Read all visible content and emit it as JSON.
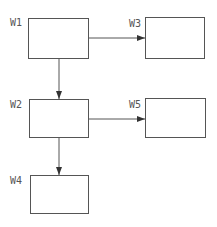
{
  "diagram": {
    "type": "flow",
    "nodes": [
      {
        "id": "W1",
        "label": "W1",
        "x": 28,
        "y": 18,
        "w": 61,
        "h": 41,
        "label_x": 10,
        "label_y": 18
      },
      {
        "id": "W2",
        "label": "W2",
        "x": 29,
        "y": 99,
        "w": 60,
        "h": 39,
        "label_x": 10,
        "label_y": 100
      },
      {
        "id": "W3",
        "label": "W3",
        "x": 145,
        "y": 17,
        "w": 60,
        "h": 42,
        "label_x": 129,
        "label_y": 19
      },
      {
        "id": "W4",
        "label": "W4",
        "x": 30,
        "y": 175,
        "w": 59,
        "h": 39,
        "label_x": 10,
        "label_y": 176
      },
      {
        "id": "W5",
        "label": "W5",
        "x": 145,
        "y": 98,
        "w": 61,
        "h": 40,
        "label_x": 129,
        "label_y": 100
      }
    ],
    "edges": [
      {
        "from": "W1",
        "to": "W3",
        "x1": 89,
        "y1": 38,
        "x2": 145,
        "y2": 38
      },
      {
        "from": "W1",
        "to": "W2",
        "x1": 59,
        "y1": 59,
        "x2": 59,
        "y2": 99
      },
      {
        "from": "W2",
        "to": "W5",
        "x1": 89,
        "y1": 119,
        "x2": 145,
        "y2": 119
      },
      {
        "from": "W2",
        "to": "W4",
        "x1": 59,
        "y1": 138,
        "x2": 59,
        "y2": 175
      }
    ],
    "colors": {
      "stroke": "#555555",
      "background": "#ffffff"
    }
  }
}
